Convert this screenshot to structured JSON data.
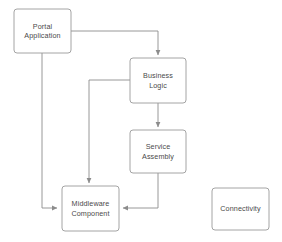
{
  "diagram": {
    "background_color": "#ffffff",
    "box_stroke_color": "#9a9a9a",
    "box_fill_color": "#ffffff",
    "connector_color": "#8c8c8c",
    "text_color": "#4a4a4a",
    "nodes": [
      {
        "id": "portal-application",
        "label": "Portal\nApplication",
        "x": 14,
        "y": 9,
        "width": 57,
        "height": 44
      },
      {
        "id": "business-logic",
        "label": "Business\nLogic",
        "x": 130,
        "y": 58,
        "width": 56,
        "height": 45
      },
      {
        "id": "service-assembly",
        "label": "Service\nAssembly",
        "x": 130,
        "y": 130,
        "width": 56,
        "height": 43
      },
      {
        "id": "middleware-component",
        "label": "Middleware\nComponent",
        "x": 62,
        "y": 186,
        "width": 57,
        "height": 45
      },
      {
        "id": "connectivity",
        "label": "Connectivity",
        "x": 212,
        "y": 188,
        "width": 57,
        "height": 42
      }
    ],
    "connectors": [
      {
        "id": "portal-to-business-logic",
        "from": "portal-application",
        "to": "business-logic",
        "points": "71,31 158,31 158,56",
        "arrow_at": "158,57"
      },
      {
        "id": "portal-to-middleware",
        "from": "portal-application",
        "to": "middleware-component",
        "points": "42,53 42,208 59,208",
        "arrow_at": "61,208"
      },
      {
        "id": "business-logic-to-service-assembly",
        "from": "business-logic",
        "to": "service-assembly",
        "points": "158,103 158,128",
        "arrow_at": "158,129"
      },
      {
        "id": "business-logic-to-middleware",
        "from": "business-logic",
        "to": "middleware-component",
        "points": "130,80 89,80 89,184",
        "arrow_at": "89,185"
      },
      {
        "id": "service-assembly-to-middleware",
        "from": "service-assembly",
        "to": "middleware-component",
        "points": "158,173 158,208 121,208",
        "arrow_at": "119,208"
      }
    ]
  }
}
